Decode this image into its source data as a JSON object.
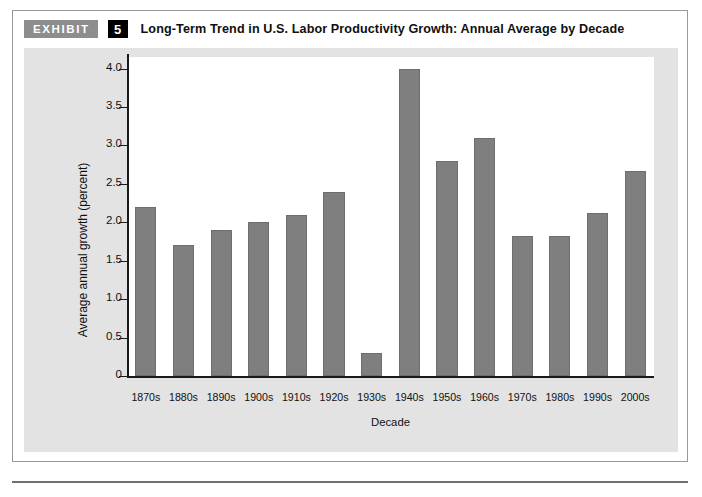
{
  "exhibit": {
    "tag_label": "EXHIBIT",
    "number": "5",
    "title": "Long-Term Trend in U.S. Labor Productivity Growth: Annual Average by Decade"
  },
  "colors": {
    "bar_fill": "#7f7f7f",
    "bar_stroke": "#6e6e6e",
    "panel_background": "#e3e3e3",
    "plot_background": "#ffffff",
    "axis": "#1a1a1a",
    "tag_background": "#8d8d8d",
    "number_background": "#000000"
  },
  "chart_data": {
    "type": "bar",
    "title": "Long-Term Trend in U.S. Labor Productivity Growth: Annual Average by Decade",
    "xlabel": "Decade",
    "ylabel": "Average annual growth (percent)",
    "categories": [
      "1870s",
      "1880s",
      "1890s",
      "1900s",
      "1910s",
      "1920s",
      "1930s",
      "1940s",
      "1950s",
      "1960s",
      "1970s",
      "1980s",
      "1990s",
      "2000s"
    ],
    "values": [
      2.2,
      1.7,
      1.9,
      2.0,
      2.1,
      2.4,
      0.3,
      4.0,
      2.8,
      3.1,
      1.82,
      1.82,
      2.12,
      2.67
    ],
    "ylim": [
      0,
      4.15
    ],
    "yticks": [
      0,
      0.5,
      1.0,
      1.5,
      2.0,
      2.5,
      3.0,
      3.5,
      4.0
    ],
    "ytick_labels": [
      "0",
      "0.5",
      "1.0",
      "1.5",
      "2.0",
      "2.5",
      "3.0",
      "3.5",
      "4.0"
    ],
    "grid": false,
    "legend": "none"
  }
}
